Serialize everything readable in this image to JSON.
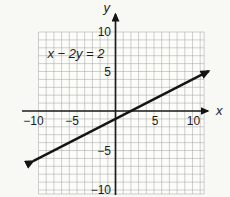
{
  "figure": {
    "equation_label": "x − 2y = 2",
    "x_axis_label": "x",
    "y_axis_label": "y"
  },
  "chart_data": {
    "type": "line",
    "title": "",
    "equation": "x − 2y = 2",
    "slope": 0.5,
    "y_intercept": -1,
    "x_intercept": 2,
    "xlabel": "x",
    "ylabel": "y",
    "xlim": [
      -10,
      10
    ],
    "ylim": [
      -10,
      10
    ],
    "grid": true,
    "grid_step": 1,
    "xticks": [
      -10,
      -5,
      5,
      10
    ],
    "xtick_labels": [
      "−10",
      "−5",
      "5",
      "10"
    ],
    "yticks": [
      10,
      5,
      -5,
      -10
    ],
    "ytick_labels": [
      "10",
      "5",
      "−5",
      "−10"
    ],
    "series": [
      {
        "name": "x − 2y = 2",
        "points": [
          [
            -10,
            -6
          ],
          [
            -6,
            -4
          ],
          [
            -2,
            -2
          ],
          [
            0,
            -1
          ],
          [
            2,
            0
          ],
          [
            6,
            2
          ],
          [
            10,
            4
          ]
        ],
        "arrow_both_ends": true,
        "color": "#141414"
      }
    ],
    "legend": "none",
    "colors": {
      "grid": "#a8a8a8",
      "axis": "#1c1c1c",
      "line": "#141414",
      "text": "#1c1c1c",
      "background": "#f8f8f5"
    }
  }
}
